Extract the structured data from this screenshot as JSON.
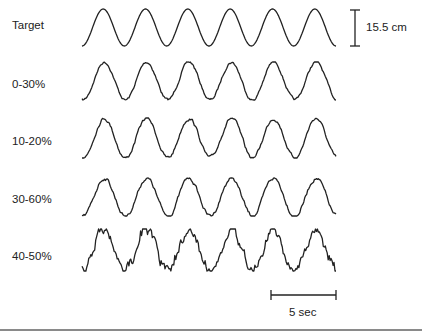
{
  "chart_data": {
    "type": "line",
    "title": "",
    "xlabel": "time",
    "ylabel": "position",
    "grid": false,
    "legend": "none",
    "series": [
      {
        "name": "Target",
        "style": "smooth sinusoid",
        "cycles": 6,
        "noise": 0
      },
      {
        "name": "0-30%",
        "style": "tracking trace",
        "cycles": 6,
        "noise": 0.05
      },
      {
        "name": "10-20%",
        "style": "tracking trace",
        "cycles": 6,
        "noise": 0.06
      },
      {
        "name": "30-60%",
        "style": "tracking trace",
        "cycles": 6,
        "noise": 0.07
      },
      {
        "name": "40-50%",
        "style": "tracking trace",
        "cycles": 6,
        "noise": 0.16
      }
    ],
    "annotations": [
      {
        "type": "vertical-scale-bar",
        "label": "15.5 cm"
      },
      {
        "type": "horizontal-scale-bar",
        "label": "5 sec"
      }
    ]
  },
  "labels": {
    "rows": [
      "Target",
      "0-30%",
      "10-20%",
      "30-60%",
      "40-50%"
    ],
    "amplitude_scale": "15.5 cm",
    "time_scale": "5 sec"
  }
}
